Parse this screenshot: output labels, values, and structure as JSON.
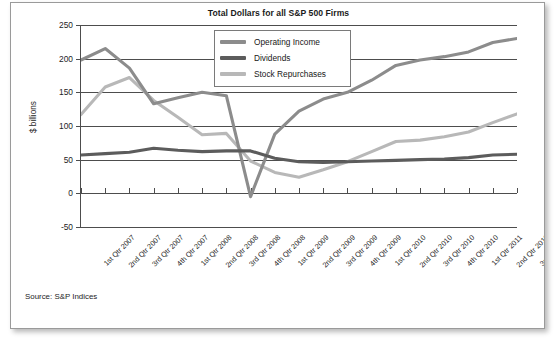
{
  "figure": {
    "source_note": "Source: S&P Indices"
  },
  "chart_data": {
    "type": "line",
    "title": "Total Dollars for all S&P 500 Firms",
    "xlabel": "",
    "ylabel": "$ billions",
    "ylim": [
      -50,
      250
    ],
    "yticks": [
      250,
      200,
      150,
      100,
      50,
      0,
      -50
    ],
    "ytick_labels": [
      "250",
      "200",
      "150",
      "100",
      "50",
      "0",
      "-50"
    ],
    "grid": true,
    "legend_position": "top-center",
    "categories": [
      "1st Qtr 2007",
      "2nd Qtr 2007",
      "3rd Qtr 2007",
      "4th Qtr 2007",
      "1st Qtr 2008",
      "2nd Qtr 2008",
      "3rd Qtr 2008",
      "4th Qtr 2008",
      "1st Qtr 2009",
      "2nd Qtr 2009",
      "3rd Qtr 2009",
      "4th Qtr 2009",
      "1st Qtr 2010",
      "2nd Qtr 2010",
      "3rd Qtr 2010",
      "4th Qtr 2010",
      "1st Qtr 2011",
      "2nd Qtr 2011",
      "3rd Qtr 2011"
    ],
    "series": [
      {
        "name": "Operating Income",
        "color": "#8c8c8c",
        "values": [
          198,
          215,
          186,
          133,
          142,
          150,
          145,
          -5,
          88,
          122,
          140,
          150,
          168,
          190,
          198,
          203,
          210,
          224,
          230
        ]
      },
      {
        "name": "Dividends",
        "color": "#5c5c5c",
        "values": [
          57,
          59,
          61,
          67,
          64,
          62,
          63,
          63,
          52,
          47,
          46,
          47,
          48,
          49,
          50,
          51,
          53,
          57,
          58
        ]
      },
      {
        "name": "Stock Repurchases",
        "color": "#b8b8b8",
        "values": [
          117,
          158,
          172,
          138,
          113,
          87,
          89,
          48,
          31,
          24,
          35,
          47,
          62,
          77,
          79,
          84,
          91,
          105,
          118
        ]
      }
    ]
  }
}
